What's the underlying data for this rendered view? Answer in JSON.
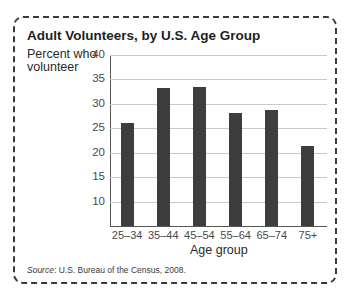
{
  "chart_data": {
    "type": "bar",
    "title": "Adult Volunteers, by U.S. Age Group",
    "ylabel": "Percent who volunteer",
    "xlabel": "Age group",
    "categories": [
      "25–34",
      "35–44",
      "45–54",
      "55–64",
      "65–74",
      "75+"
    ],
    "values": [
      26.1,
      33.3,
      33.5,
      28.1,
      28.8,
      21.4
    ],
    "ylim": [
      5,
      40
    ],
    "yticks": [
      10,
      15,
      20,
      25,
      30,
      35,
      40
    ],
    "grid": true,
    "legend": null,
    "source_label": "Source",
    "source_text": ": U.S. Bureau of the Census, 2008.",
    "bar_color": "#3d3d3d"
  }
}
